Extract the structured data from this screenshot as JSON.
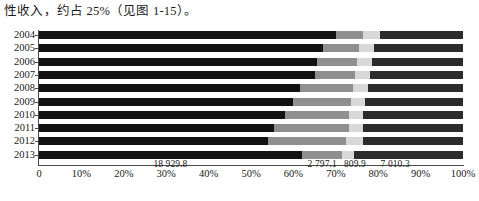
{
  "caption": {
    "text": "性收入，约占 25%（见图 1-15）。"
  },
  "chart_data": {
    "type": "bar",
    "orientation": "horizontal",
    "stacked": true,
    "stack_mode": "percent",
    "title": "",
    "xlabel": "",
    "ylabel": "",
    "xlim": [
      0,
      100
    ],
    "grid": false,
    "legend": "none",
    "xticks": [
      "0",
      "10%",
      "20%",
      "30%",
      "40%",
      "50%",
      "60%",
      "70%",
      "80%",
      "90%",
      "100%"
    ],
    "xtick_values": [
      0,
      10,
      20,
      30,
      40,
      50,
      60,
      70,
      80,
      90,
      100
    ],
    "categories": [
      "2004",
      "2005",
      "2006",
      "2007",
      "2008",
      "2009",
      "2010",
      "2011",
      "2012",
      "2013"
    ],
    "series": [
      {
        "name": "segment-1",
        "color": "#121212",
        "values": [
          70.0,
          67.0,
          65.5,
          65.0,
          61.5,
          60.0,
          58.0,
          55.5,
          54.0,
          62.0
        ]
      },
      {
        "name": "segment-2",
        "color": "#8f8f8f",
        "values": [
          6.5,
          8.5,
          9.5,
          9.5,
          12.5,
          13.5,
          15.0,
          17.5,
          18.5,
          9.5
        ]
      },
      {
        "name": "segment-3",
        "color": "#d8d8d8",
        "values": [
          4.0,
          3.5,
          3.5,
          3.5,
          3.5,
          3.5,
          3.5,
          3.5,
          4.0,
          2.7
        ]
      },
      {
        "name": "segment-4",
        "color": "#2b2b2b",
        "values": [
          19.5,
          21.0,
          21.5,
          22.0,
          22.5,
          23.0,
          23.5,
          23.5,
          23.5,
          25.8
        ]
      }
    ],
    "value_labels": [
      {
        "text": "18 929.8",
        "at_percent": 31.0
      },
      {
        "text": "2 797.1",
        "at_percent": 66.8
      },
      {
        "text": "809.9",
        "at_percent": 74.5
      },
      {
        "text": "7 010.3",
        "at_percent": 84.0
      }
    ]
  }
}
